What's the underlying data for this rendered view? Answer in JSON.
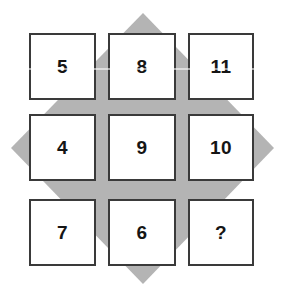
{
  "puzzle": {
    "type": "number-grid-logic-puzzle",
    "background_shape": "diamond",
    "background_color": "#b4b4b4",
    "cell_border_color": "#3a3a3a",
    "cell_fill_color": "#ffffff",
    "text_color": "#151515",
    "rows": 3,
    "columns": 3,
    "cells": [
      {
        "id": "cell-r0c0",
        "row": 0,
        "col": 0,
        "label": "5",
        "is_unknown": false
      },
      {
        "id": "cell-r0c1",
        "row": 0,
        "col": 1,
        "label": "8",
        "is_unknown": false
      },
      {
        "id": "cell-r0c2",
        "row": 0,
        "col": 2,
        "label": "11",
        "is_unknown": false
      },
      {
        "id": "cell-r1c0",
        "row": 1,
        "col": 0,
        "label": "4",
        "is_unknown": false
      },
      {
        "id": "cell-r1c1",
        "row": 1,
        "col": 1,
        "label": "9",
        "is_unknown": false
      },
      {
        "id": "cell-r1c2",
        "row": 1,
        "col": 2,
        "label": "10",
        "is_unknown": false
      },
      {
        "id": "cell-r2c0",
        "row": 2,
        "col": 0,
        "label": "7",
        "is_unknown": false
      },
      {
        "id": "cell-r2c1",
        "row": 2,
        "col": 1,
        "label": "6",
        "is_unknown": false
      },
      {
        "id": "cell-r2c2",
        "row": 2,
        "col": 2,
        "label": "?",
        "is_unknown": true
      }
    ]
  }
}
